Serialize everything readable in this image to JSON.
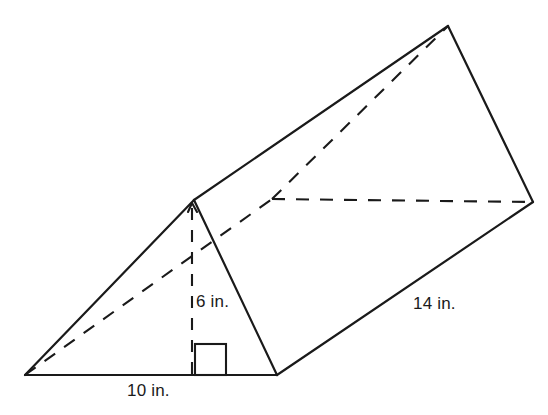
{
  "figure": {
    "kind": "triangular-prism",
    "units": "in.",
    "stroke_color": "#1a1a1a",
    "background_color": "#ffffff"
  },
  "labels": {
    "base": "10 in.",
    "height": "6 in.",
    "length": "14 in."
  },
  "measurements": {
    "base_value": 10,
    "height_value": 6,
    "length_value": 14,
    "unit": "in."
  },
  "geometry": {
    "vertices": {
      "front_bottom_left": [
        25,
        375
      ],
      "front_bottom_right": [
        277,
        375
      ],
      "front_apex": [
        194,
        200
      ],
      "back_bottom_left": [
        272,
        199
      ],
      "back_apex": [
        448,
        26
      ],
      "back_bottom_right": [
        533,
        202
      ]
    },
    "solid_edges": [
      [
        [
          25,
          375
        ],
        [
          277,
          375
        ]
      ],
      [
        [
          25,
          375
        ],
        [
          194,
          200
        ]
      ],
      [
        [
          194,
          200
        ],
        [
          277,
          375
        ]
      ],
      [
        [
          194,
          200
        ],
        [
          448,
          26
        ]
      ],
      [
        [
          448,
          26
        ],
        [
          533,
          202
        ]
      ],
      [
        [
          533,
          202
        ],
        [
          277,
          375
        ]
      ]
    ],
    "dashed_edges": [
      [
        [
          25,
          375
        ],
        [
          272,
          199
        ]
      ],
      [
        [
          272,
          199
        ],
        [
          533,
          202
        ]
      ],
      [
        [
          272,
          199
        ],
        [
          448,
          26
        ]
      ]
    ],
    "height_segment": [
      [
        192,
        208
      ],
      [
        192,
        375
      ]
    ],
    "right_angle_marker": {
      "x": 195,
      "y": 344,
      "size": 31
    }
  }
}
